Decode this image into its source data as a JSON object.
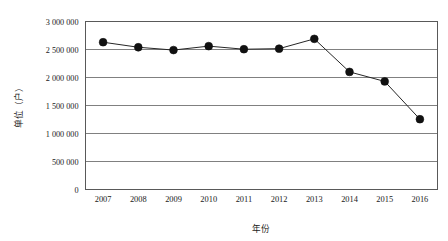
{
  "chart_data": {
    "type": "line",
    "title": "",
    "xlabel": "年份",
    "ylabel": "单位（户）",
    "categories": [
      "2007",
      "2008",
      "2009",
      "2010",
      "2011",
      "2012",
      "2013",
      "2014",
      "2015",
      "2016"
    ],
    "values": [
      2630000,
      2540000,
      2490000,
      2560000,
      2505000,
      2515000,
      2690000,
      2100000,
      1930000,
      1255000
    ],
    "series": [
      {
        "name": "",
        "values": [
          2630000,
          2540000,
          2490000,
          2560000,
          2505000,
          2515000,
          2690000,
          2100000,
          1930000,
          1255000
        ]
      }
    ],
    "ylim": [
      0,
      3000000
    ],
    "ytick_values": [
      0,
      500000,
      1000000,
      1500000,
      2000000,
      2500000,
      3000000
    ],
    "ytick_labels": [
      "0",
      "500 000",
      "1 000 000",
      "1 500 000",
      "2 000 000",
      "2 500 000",
      "3 000 000"
    ],
    "grid": true,
    "legend": "none",
    "marker": "circle",
    "line_color": "#262626",
    "marker_color": "#111111",
    "grid_color": "#808080",
    "background_color": "#ffffff"
  }
}
